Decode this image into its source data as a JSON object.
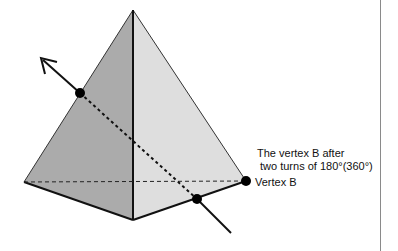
{
  "diagram": {
    "type": "pyramid-rotation-illustration",
    "shape": "tetrahedron",
    "colors": {
      "left_face": "#ababab",
      "right_face": "#dedede",
      "edges": "#111111",
      "points": "#000000",
      "frame_line": "#8a8a8a"
    },
    "points": {
      "apex": [
        133,
        10
      ],
      "left_corner": [
        24,
        182
      ],
      "bottom_corner": [
        133,
        220
      ],
      "vertex_b": [
        246,
        181
      ],
      "axis_upper_point": [
        80,
        93
      ],
      "axis_lower_point": [
        197,
        199
      ],
      "arrow_tip": [
        41,
        58
      ],
      "axis_end": [
        231,
        233
      ]
    },
    "labels": {
      "after_line1": "The vertex B after",
      "after_line2": "two turns of 180°(360°)",
      "vertex_b": "Vertex B"
    }
  }
}
